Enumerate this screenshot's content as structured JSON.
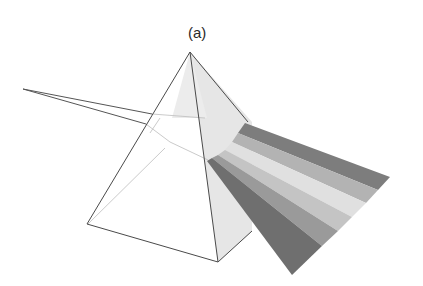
{
  "figure": {
    "label": "(a)",
    "colors": {
      "outline": "#555555",
      "face_shade": "#e4e4e4",
      "band_dark": "#7a7a7a",
      "band_mid": "#a8a8a8",
      "band_light": "#d6d6d6",
      "band_lightest": "#ececec"
    }
  }
}
